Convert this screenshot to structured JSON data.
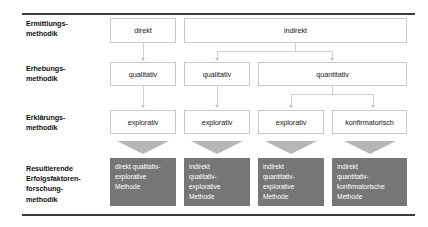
{
  "diagram": {
    "accent_box_color": "#767676",
    "rule_color": "#3b3b3b",
    "connector_color": "#cfcfcf",
    "row_labels": [
      "Ermittlungs-\nmethodik",
      "Erhebungs-\nmethodik",
      "Erklärungs-\nmethodik",
      "Resultierende\nErfolgsfaktoren-\nforschung-\nmethodik"
    ],
    "rows": {
      "ermittlung": [
        {
          "label": "direkt"
        },
        {
          "label": "indirekt"
        }
      ],
      "erhebung": [
        {
          "label": "qualitativ"
        },
        {
          "label": "qualitativ"
        },
        {
          "label": "quantitativ"
        }
      ],
      "erklaerung": [
        {
          "label": "explorativ"
        },
        {
          "label": "explorativ"
        },
        {
          "label": "explorativ"
        },
        {
          "label": "konfirmatorisch"
        }
      ],
      "resultat": [
        {
          "label": "direkt qualitativ-\nexplorative\nMethode"
        },
        {
          "label": "indirekt\nqualitativ-\nexplorative\nMethode"
        },
        {
          "label": "indirekt\nquantitativ-\nexplorative\nMethode"
        },
        {
          "label": "indirekt\nquantitativ-\nkonfirmatorische\nMethode"
        }
      ]
    }
  }
}
